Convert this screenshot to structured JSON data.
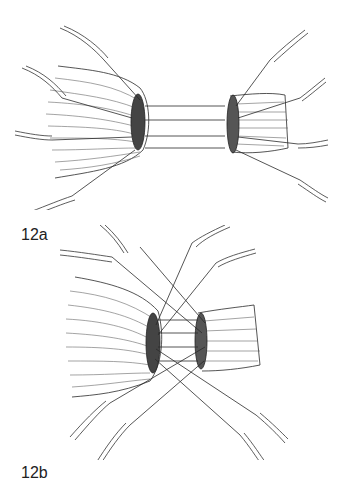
{
  "figures": [
    {
      "id": "12a",
      "label": "12a",
      "description": "Two nerve stumps held apart by four parallel sutures; each stump has guide sutures attached to needles"
    },
    {
      "id": "12b",
      "label": "12b",
      "description": "Nerve stumps approximated with crossing sutures attached to needles"
    }
  ],
  "colors": {
    "line": "#2a2a2a",
    "hatch": "#555555",
    "background": "#ffffff"
  }
}
